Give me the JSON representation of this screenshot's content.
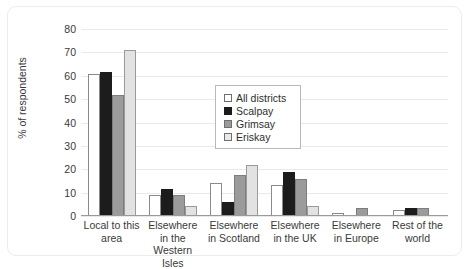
{
  "chart_data": {
    "type": "bar",
    "title": "",
    "xlabel": "",
    "ylabel": "% of respondents",
    "ylim": [
      0,
      80
    ],
    "ytick_step": 10,
    "yticks": [
      80,
      70,
      60,
      50,
      40,
      30,
      20,
      10,
      0
    ],
    "grid": true,
    "legend_position": "center",
    "categories": [
      "Local to this area",
      "Elsewhere in the Western Isles",
      "Elsewhere in Scotland",
      "Elsewhere in the UK",
      "Elsewhere in Europe",
      "Rest of the world"
    ],
    "series": [
      {
        "name": "All districts",
        "color": "#ffffff",
        "values": [
          60.5,
          8.5,
          13.5,
          13.0,
          1.0,
          2.0
        ]
      },
      {
        "name": "Scalpay",
        "color": "#1c1c1c",
        "values": [
          61.0,
          11.0,
          5.5,
          18.5,
          0.0,
          3.0
        ]
      },
      {
        "name": "Grimsay",
        "color": "#9b9b9b",
        "values": [
          51.5,
          8.5,
          17.0,
          15.5,
          3.2,
          3.2
        ]
      },
      {
        "name": "Eriskay",
        "color": "#e2e2e2",
        "values": [
          70.5,
          3.8,
          21.5,
          3.8,
          0.0,
          0.0
        ]
      }
    ]
  },
  "legend": {
    "items": [
      {
        "label": "All districts"
      },
      {
        "label": "Scalpay"
      },
      {
        "label": "Grimsay"
      },
      {
        "label": "Eriskay"
      }
    ]
  }
}
